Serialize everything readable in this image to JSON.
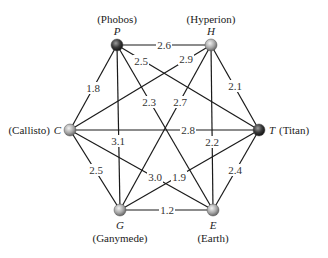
{
  "diagram": {
    "type": "complete-weighted-graph",
    "nodes": [
      {
        "id": "P",
        "letter": "P",
        "name": "(Phobos)",
        "x": 117,
        "y": 45,
        "shade": "dark"
      },
      {
        "id": "H",
        "letter": "H",
        "name": "(Hyperion)",
        "x": 211,
        "y": 45,
        "shade": "light"
      },
      {
        "id": "C",
        "letter": "C",
        "name": "(Callisto)",
        "x": 70,
        "y": 130,
        "shade": "light"
      },
      {
        "id": "T",
        "letter": "T",
        "name": "(Titan)",
        "x": 259,
        "y": 130,
        "shade": "dark"
      },
      {
        "id": "G",
        "letter": "G",
        "name": "(Ganymede)",
        "x": 120,
        "y": 210,
        "shade": "light"
      },
      {
        "id": "E",
        "letter": "E",
        "name": "(Earth)",
        "x": 213,
        "y": 210,
        "shade": "light"
      }
    ],
    "edges": [
      {
        "from": "P",
        "to": "H",
        "weight": "2.6",
        "lx": 164,
        "ly": 45
      },
      {
        "from": "P",
        "to": "C",
        "weight": "1.8",
        "lx": 93,
        "ly": 88
      },
      {
        "from": "P",
        "to": "G",
        "weight": "3.1",
        "lx": 118,
        "ly": 141
      },
      {
        "from": "P",
        "to": "E",
        "weight": "2.3",
        "lx": 149,
        "ly": 102
      },
      {
        "from": "P",
        "to": "T",
        "weight": "2.5",
        "lx": 141,
        "ly": 61
      },
      {
        "from": "H",
        "to": "C",
        "weight": "2.9",
        "lx": 186,
        "ly": 59
      },
      {
        "from": "H",
        "to": "G",
        "weight": "2.7",
        "lx": 180,
        "ly": 102
      },
      {
        "from": "H",
        "to": "E",
        "weight": "2.2",
        "lx": 212,
        "ly": 142
      },
      {
        "from": "H",
        "to": "T",
        "weight": "2.1",
        "lx": 235,
        "ly": 86
      },
      {
        "from": "C",
        "to": "T",
        "weight": "2.8",
        "lx": 188,
        "ly": 130
      },
      {
        "from": "C",
        "to": "G",
        "weight": "2.5",
        "lx": 96,
        "ly": 170
      },
      {
        "from": "C",
        "to": "E",
        "weight": "3.0",
        "lx": 155,
        "ly": 177
      },
      {
        "from": "G",
        "to": "T",
        "weight": "1.9",
        "lx": 179,
        "ly": 177
      },
      {
        "from": "G",
        "to": "E",
        "weight": "1.2",
        "lx": 167,
        "ly": 210
      },
      {
        "from": "E",
        "to": "T",
        "weight": "2.4",
        "lx": 235,
        "ly": 170
      }
    ]
  }
}
